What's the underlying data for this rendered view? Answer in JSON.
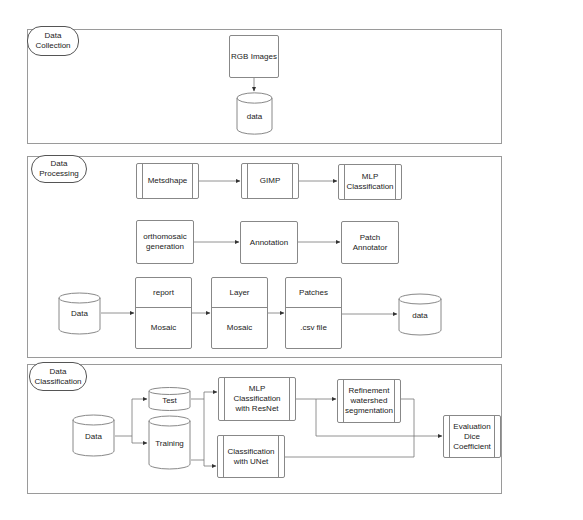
{
  "sections": [
    {
      "label": "Data\nCollection",
      "nodes": {
        "rgb_images": "RGB Images",
        "data": "data"
      }
    },
    {
      "label": "Data\nProcessing",
      "nodes": {
        "metashape": "Metsdhape",
        "gimp": "GIMP",
        "mlp_classification": "MLP\nClassification",
        "orthomosaic": "orthomosaic\ngeneration",
        "annotation": "Annotation",
        "patch_annotator": "Patch\nAnnotator",
        "data_in": "Data",
        "report_top": "report",
        "report_bottom": "Mosaic",
        "layer_top": "Layer",
        "layer_bottom": "Mosaic",
        "patches_top": "Patches",
        "patches_bottom": ".csv file",
        "data_out": "data"
      }
    },
    {
      "label": "Data\nClassification",
      "nodes": {
        "data": "Data",
        "test": "Test",
        "training": "Training",
        "mlp_resnet": "MLP\nClassification\nwith ResNet",
        "unet": "Classification\nwith UNet",
        "refinement": "Refinement\nwatershed\nsegmentation",
        "evaluation": "Evaluation\nDice\nCoefficient"
      }
    }
  ],
  "colors": {
    "stroke": "#888888",
    "section_border": "#9a9a9a",
    "text": "#222222",
    "arrow": "#333333"
  }
}
